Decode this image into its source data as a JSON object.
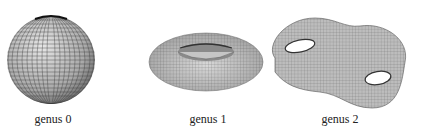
{
  "figure": {
    "panels": [
      {
        "label": "genus 0",
        "shape": "sphere"
      },
      {
        "label": "genus 1",
        "shape": "torus"
      },
      {
        "label": "genus 2",
        "shape": "double-torus"
      }
    ],
    "colors": {
      "surface": "#b8b8b8",
      "mesh": "#4a4a4a",
      "background": "#ffffff"
    }
  }
}
